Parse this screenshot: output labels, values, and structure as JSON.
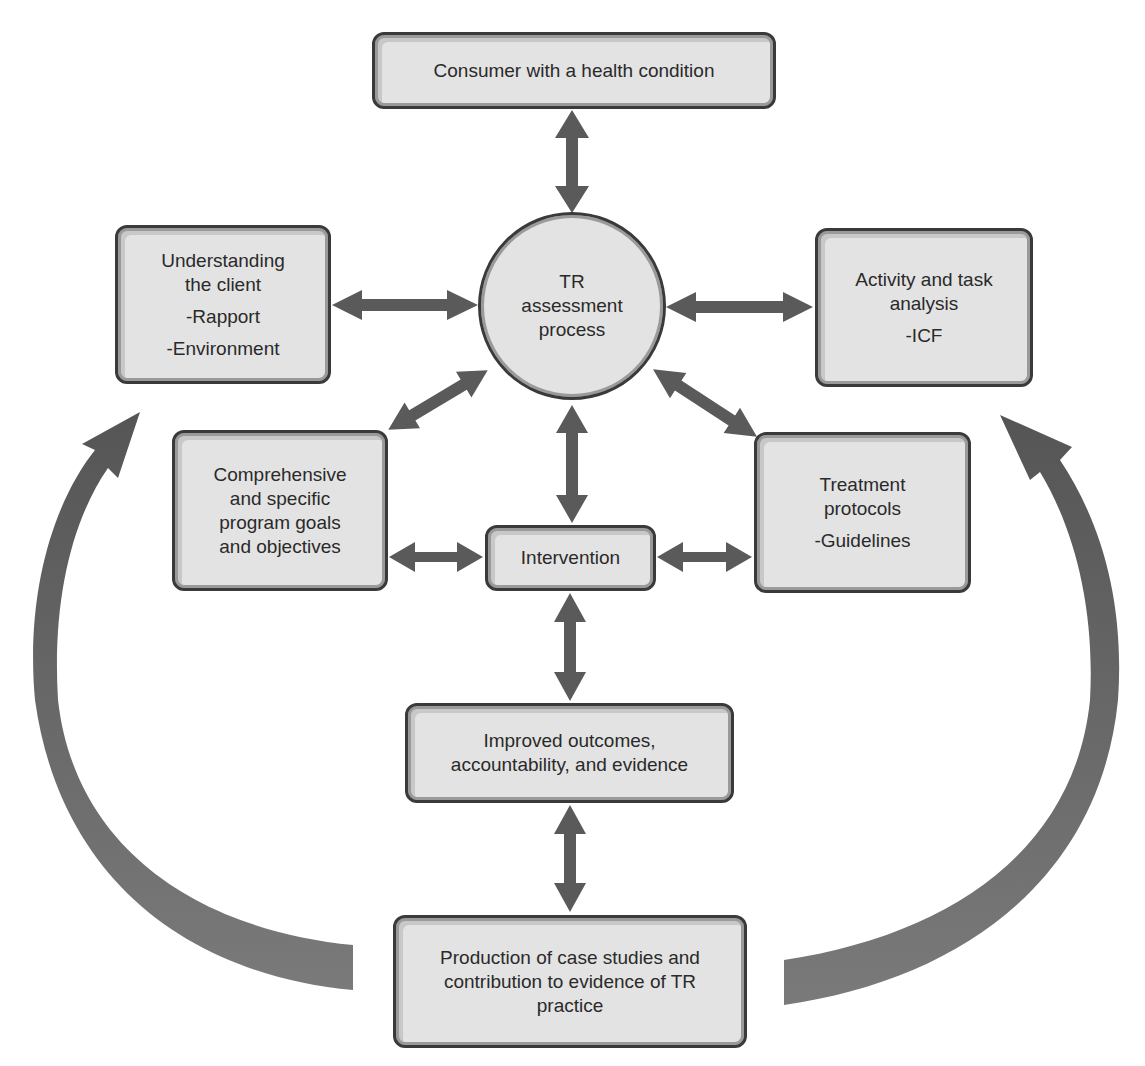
{
  "diagram": {
    "center": {
      "lines": [
        "TR",
        "assessment",
        "process"
      ]
    },
    "nodes": {
      "consumer": {
        "lines": [
          "Consumer with a health condition"
        ]
      },
      "understanding": {
        "lines": [
          "Understanding",
          "the client"
        ],
        "sub": [
          "-Rapport",
          "-Environment"
        ]
      },
      "activity": {
        "lines": [
          "Activity and task",
          "analysis"
        ],
        "sub": [
          "-ICF"
        ]
      },
      "comprehensive": {
        "lines": [
          "Comprehensive",
          "and specific",
          "program goals",
          "and objectives"
        ]
      },
      "treatment": {
        "lines": [
          "Treatment",
          "protocols"
        ],
        "sub": [
          "-Guidelines"
        ]
      },
      "intervention": {
        "lines": [
          "Intervention"
        ]
      },
      "improved": {
        "lines": [
          "Improved outcomes,",
          "accountability, and evidence"
        ]
      },
      "production": {
        "lines": [
          "Production of case studies and",
          "contribution to evidence of TR",
          "practice"
        ]
      }
    },
    "edges": [
      {
        "from": "consumer",
        "to": "center",
        "type": "bidirectional"
      },
      {
        "from": "understanding",
        "to": "center",
        "type": "bidirectional"
      },
      {
        "from": "activity",
        "to": "center",
        "type": "bidirectional"
      },
      {
        "from": "comprehensive",
        "to": "center",
        "type": "bidirectional"
      },
      {
        "from": "treatment",
        "to": "center",
        "type": "bidirectional"
      },
      {
        "from": "intervention",
        "to": "center",
        "type": "bidirectional"
      },
      {
        "from": "comprehensive",
        "to": "intervention",
        "type": "bidirectional"
      },
      {
        "from": "treatment",
        "to": "intervention",
        "type": "bidirectional"
      },
      {
        "from": "intervention",
        "to": "improved",
        "type": "bidirectional"
      },
      {
        "from": "improved",
        "to": "production",
        "type": "bidirectional"
      },
      {
        "from": "production",
        "to": "understanding",
        "type": "curved-feedback"
      },
      {
        "from": "production",
        "to": "activity",
        "type": "curved-feedback"
      }
    ],
    "colors": {
      "box_fill": "#e3e3e3",
      "box_border": "#3a3a3a",
      "arrow": "#5a5a5a",
      "curve_arrow": "#6e6e6e",
      "text": "#2a2a2a"
    }
  }
}
